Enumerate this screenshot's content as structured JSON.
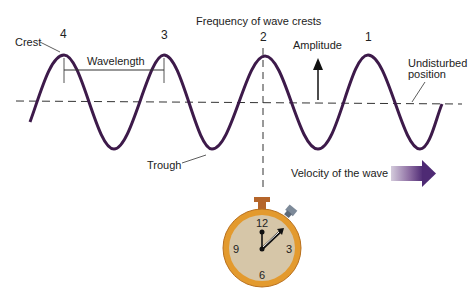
{
  "title": "Frequency of wave crests",
  "labels": {
    "crest": "Crest",
    "trough": "Trough",
    "wavelength": "Wavelength",
    "amplitude": "Amplitude",
    "undisturbed_line1": "Undisturbed",
    "undisturbed_line2": "position",
    "velocity": "Velocity of the wave"
  },
  "crest_numbers": [
    "4",
    "3",
    "2",
    "1"
  ],
  "stopwatch": {
    "numbers": {
      "twelve": "12",
      "three": "3",
      "six": "6",
      "nine": "9"
    }
  },
  "colors": {
    "wave": "#3d1a4a",
    "stopwatch_rim": "#e39a2e",
    "stopwatch_face": "#d6c6a8",
    "arrow_start": "#c9bfd2",
    "arrow_end": "#4e2a74"
  }
}
